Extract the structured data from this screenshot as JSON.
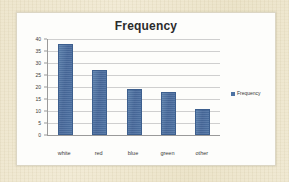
{
  "page": {
    "background_color": "#efe7cf",
    "card_background_color": "#fdfdfb"
  },
  "chart_data": {
    "type": "bar",
    "title": "Frequency",
    "xlabel": "",
    "ylabel": "",
    "categories": [
      "white",
      "red",
      "blue",
      "green",
      "other"
    ],
    "values": [
      38,
      27,
      19,
      18,
      11
    ],
    "series": [
      {
        "name": "Frequency",
        "values": [
          38,
          27,
          19,
          18,
          11
        ],
        "color": "#4e73a4"
      }
    ],
    "ylim": [
      0,
      40
    ],
    "ytick_step": 5,
    "yticks": [
      40,
      35,
      30,
      25,
      20,
      15,
      10,
      5,
      0
    ],
    "grid": true,
    "grid_axis": "y",
    "legend": {
      "visible": true,
      "position": "right",
      "entries": [
        {
          "label": "Frequency",
          "color": "#4e73a4"
        }
      ]
    },
    "bar_color": "#4e73a4",
    "bar_border_color": "#3d5f8e",
    "axis_color": "#9a9a9a",
    "gridline_color": "#cfcfcf"
  }
}
